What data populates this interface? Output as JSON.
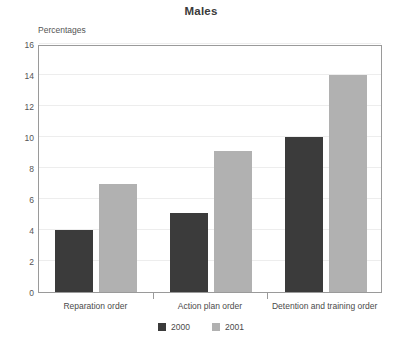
{
  "chart_data": {
    "type": "bar",
    "title": "Males",
    "subtitle": "Percentages",
    "xlabel": "",
    "ylabel": "Percentages",
    "categories": [
      "Reparation order",
      "Action plan order",
      "Detention and training order"
    ],
    "series": [
      {
        "name": "2000",
        "values": [
          4.0,
          5.1,
          10.0
        ],
        "color": "#3b3b3b"
      },
      {
        "name": "2001",
        "values": [
          7.0,
          9.1,
          14.0
        ],
        "color": "#b1b1b1"
      }
    ],
    "ylim": [
      0,
      16
    ],
    "yticks": [
      0,
      2,
      4,
      6,
      8,
      10,
      12,
      14,
      16
    ],
    "ytick_labels": [
      "0",
      "2",
      "4",
      "6",
      "8",
      "10",
      "12",
      "14",
      "16"
    ],
    "grid": true,
    "legend_position": "bottom",
    "legend_entries": [
      "2000",
      "2001"
    ]
  }
}
